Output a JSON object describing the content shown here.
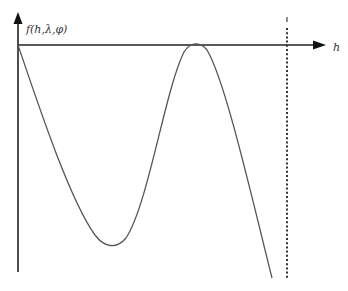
{
  "diagram": {
    "y_axis_label": "f(h,λ,φ)",
    "x_axis_label": "h",
    "caption": "",
    "colors": {
      "axis": "#222222",
      "curve": "#555555",
      "dotted_line": "#333333",
      "background": "#ffffff"
    },
    "elements": {
      "origin": [
        18,
        45
      ],
      "y_axis_end": [
        18,
        272
      ],
      "x_axis_arrow_tip": [
        326,
        45
      ],
      "curve_points": [
        [
          18,
          45
        ],
        [
          112,
          246
        ],
        [
          195,
          44
        ],
        [
          272,
          278
        ]
      ],
      "curve_features": [
        "start at origin",
        "local minimum",
        "local maximum touching h-axis",
        "descends below axis"
      ],
      "dotted_vertical_line_x": 287
    }
  }
}
